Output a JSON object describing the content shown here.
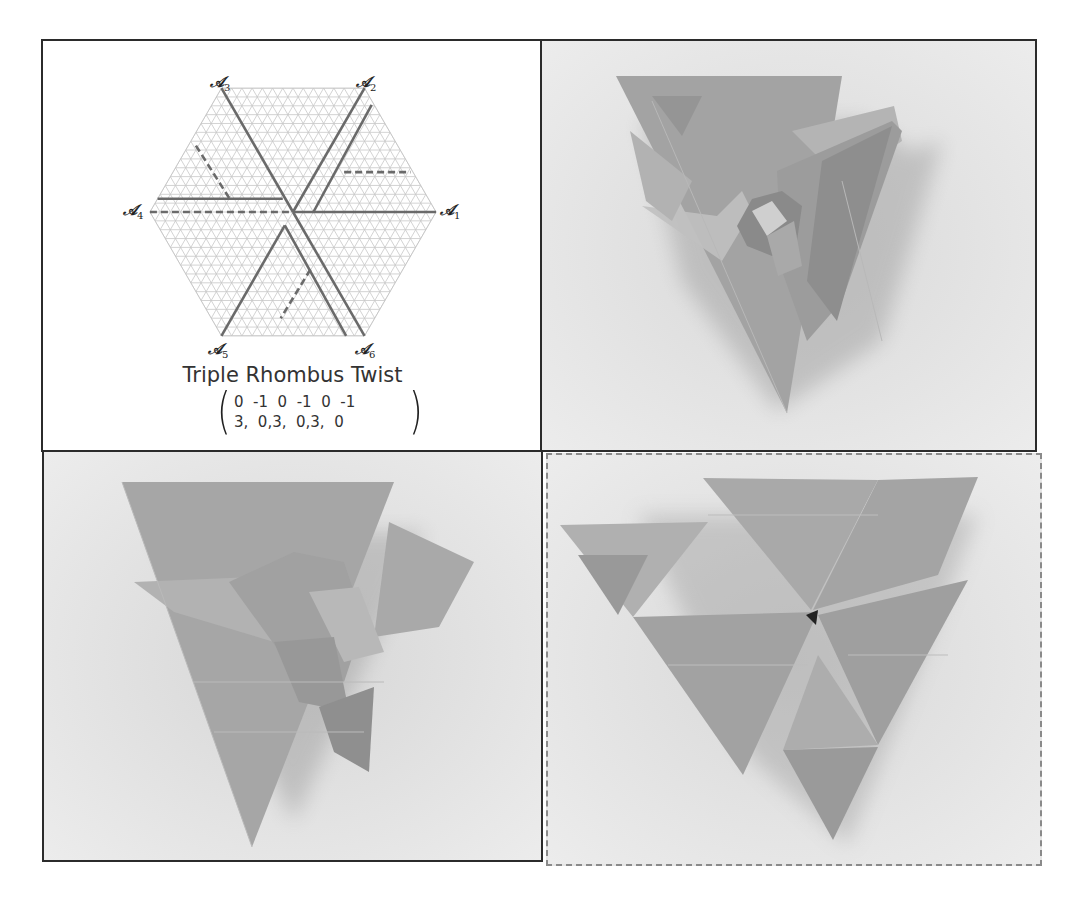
{
  "figure": {
    "panels": [
      {
        "id": "crease-diagram",
        "kind": "diagram",
        "title": "Triple Rhombus Twist",
        "axis_labels": [
          "A1",
          "A2",
          "A3",
          "A4",
          "A5",
          "A6"
        ],
        "axis_label_display": {
          "a1": {
            "letter": "𝒜",
            "sub": "1"
          },
          "a2": {
            "letter": "𝒜",
            "sub": "2"
          },
          "a3": {
            "letter": "𝒜",
            "sub": "3"
          },
          "a4": {
            "letter": "𝒜",
            "sub": "4"
          },
          "a5": {
            "letter": "𝒜",
            "sub": "5"
          },
          "a6": {
            "letter": "𝒜",
            "sub": "6"
          }
        },
        "matrix": {
          "top_row": [
            "0",
            "-1",
            "0",
            "-1",
            "0",
            "-1"
          ],
          "bottom_row": [
            "3",
            "0",
            "3",
            "0",
            "3",
            "0"
          ],
          "top_text": "0  -1  0  -1  0  -1",
          "bottom_text": "3,  0,3,  0,3,  0"
        },
        "grid": {
          "type": "triangular",
          "shape": "hexagon",
          "units_per_radius": 14
        },
        "colors": {
          "grid_line": "#c8c8c8",
          "crease_line": "#6a6a6a",
          "border": "#2b2b2b"
        }
      },
      {
        "id": "photo-folded-front",
        "kind": "photo",
        "subject": "folded origami triple rhombus twist, swirled center"
      },
      {
        "id": "photo-folded-back",
        "kind": "photo",
        "subject": "origami tessellation, pinwheel of rhombus folds"
      },
      {
        "id": "photo-flat-triangles",
        "kind": "photo",
        "subject": "flattened origami showing overlapping triangles",
        "border_style": "dashed"
      }
    ]
  }
}
